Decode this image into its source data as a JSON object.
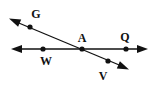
{
  "diagram": {
    "type": "geometry-lines",
    "stroke_color": "#111111",
    "lines": [
      {
        "name": "line-WQ",
        "from": [
          12,
          49
        ],
        "to": [
          147,
          49
        ],
        "arrows": "both"
      },
      {
        "name": "line-GV",
        "from": [
          10,
          19
        ],
        "to": [
          128,
          69
        ],
        "arrows": "both"
      }
    ],
    "points": [
      {
        "id": "G",
        "label": "G",
        "x": 30,
        "y": 27,
        "label_x": 36,
        "label_y": 18
      },
      {
        "id": "W",
        "label": "W",
        "x": 43,
        "y": 49,
        "label_x": 46,
        "label_y": 65
      },
      {
        "id": "A",
        "label": "A",
        "x": 82,
        "y": 49,
        "label_x": 82,
        "label_y": 42
      },
      {
        "id": "Q",
        "label": "Q",
        "x": 126,
        "y": 49,
        "label_x": 125,
        "label_y": 41
      },
      {
        "id": "V",
        "label": "V",
        "x": 108,
        "y": 61,
        "label_x": 103,
        "label_y": 80
      }
    ]
  }
}
